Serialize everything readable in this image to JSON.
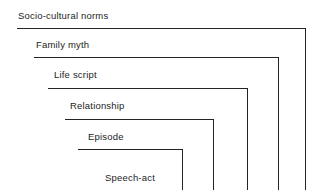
{
  "figure": {
    "name": "nested-levels-of-context-diagram",
    "background_color": "#ffffff",
    "line_color": "#232323",
    "text_color": "#1d1d1d",
    "levels": [
      {
        "label": "Socio-cultural norms",
        "label_x": 18,
        "label_y": 10,
        "line_x": 17,
        "line_y": 28,
        "line_right": 306,
        "corner_x": 305
      },
      {
        "label": "Family myth",
        "label_x": 36,
        "label_y": 39,
        "line_x": 34,
        "line_y": 57,
        "line_right": 279,
        "corner_x": 278
      },
      {
        "label": "Life script",
        "label_x": 54,
        "label_y": 69,
        "line_x": 48,
        "line_y": 88,
        "line_right": 248,
        "corner_x": 247
      },
      {
        "label": "Relationship",
        "label_x": 70,
        "label_y": 100,
        "line_x": 65,
        "line_y": 119,
        "line_right": 214,
        "corner_x": 213
      },
      {
        "label": "Episode",
        "label_x": 88,
        "label_y": 131,
        "line_x": 78,
        "line_y": 149,
        "line_right": 183,
        "corner_x": 182
      },
      {
        "label": "Speech-act",
        "label_x": 105,
        "label_y": 172,
        "line_x": null,
        "line_y": null,
        "line_right": null,
        "corner_x": null
      }
    ]
  }
}
